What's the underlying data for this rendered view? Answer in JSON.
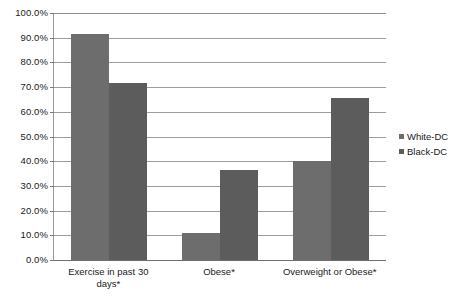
{
  "chart_data": {
    "type": "bar",
    "title": "",
    "xlabel": "",
    "ylabel": "",
    "ylim": [
      0,
      100
    ],
    "ytick_step": 10,
    "ytick_labels": [
      "100.0%",
      "90.0%",
      "80.0%",
      "70.0%",
      "60.0%",
      "50.0%",
      "40.0%",
      "30.0%",
      "20.0%",
      "10.0%",
      "0.0%"
    ],
    "grid": true,
    "legend_position": "right",
    "categories": [
      "Exercise in past 30 days*",
      "Obese*",
      "Overweight or Obese*"
    ],
    "series": [
      {
        "name": "White-DC",
        "color": "#6d6d6d",
        "values": [
          91.5,
          11.0,
          40.0
        ]
      },
      {
        "name": "Black-DC",
        "color": "#5c5c5c",
        "values": [
          71.5,
          36.5,
          65.5
        ]
      }
    ]
  },
  "axis": {
    "ticks": [
      {
        "label": "100.0%",
        "value": 100
      },
      {
        "label": "90.0%",
        "value": 90
      },
      {
        "label": "80.0%",
        "value": 80
      },
      {
        "label": "70.0%",
        "value": 70
      },
      {
        "label": "60.0%",
        "value": 60
      },
      {
        "label": "50.0%",
        "value": 50
      },
      {
        "label": "40.0%",
        "value": 40
      },
      {
        "label": "30.0%",
        "value": 30
      },
      {
        "label": "20.0%",
        "value": 20
      },
      {
        "label": "10.0%",
        "value": 10
      },
      {
        "label": "0.0%",
        "value": 0
      }
    ]
  },
  "legend": {
    "items": [
      {
        "label": "White-DC",
        "color": "#6d6d6d"
      },
      {
        "label": "Black-DC",
        "color": "#5c5c5c"
      }
    ]
  },
  "colors": {
    "white_dc": "#6d6d6d",
    "black_dc": "#5c5c5c",
    "gridline": "#9d9d9d",
    "axis": "#6e6e6e",
    "background": "#ffffff"
  }
}
